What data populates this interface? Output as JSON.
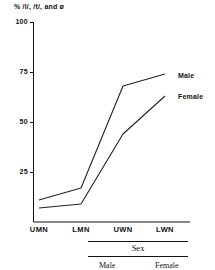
{
  "chart_data": {
    "type": "line",
    "title": "% /l/, /t/, and ø",
    "xlabel": "Sex",
    "ylabel": "",
    "categories": [
      "UMN",
      "LMN",
      "UWN",
      "LWN"
    ],
    "series": [
      {
        "name": "Male",
        "values": [
          11,
          17,
          68,
          74
        ]
      },
      {
        "name": "Female",
        "values": [
          7,
          9,
          44,
          63
        ]
      }
    ],
    "ylim": [
      0,
      100
    ],
    "yticks": [
      25,
      50,
      75,
      100
    ],
    "ytick_labels": [
      "25",
      "50",
      "75",
      "100"
    ],
    "grid": false,
    "legend_position": "right-inline",
    "legend_entries": [
      "Male",
      "Female"
    ]
  },
  "footer": {
    "caption": "Sex",
    "male": "Male",
    "female": "Female"
  },
  "colors": {
    "line": "#222222",
    "axis": "#111111",
    "background": "#ffffff"
  }
}
